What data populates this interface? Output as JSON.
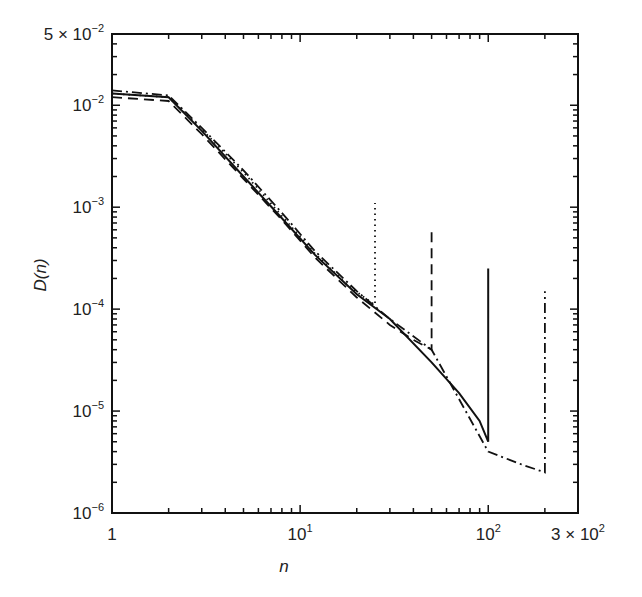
{
  "chart_data": {
    "type": "line",
    "title": "",
    "xlabel": "n",
    "ylabel": "D(n)",
    "xscale": "log",
    "yscale": "log",
    "xlim": [
      1,
      300
    ],
    "ylim": [
      1e-06,
      0.05
    ],
    "grid": false,
    "legend": null,
    "x_tick_labels": [
      "1",
      "10^1",
      "10^2",
      "3 × 10^2"
    ],
    "y_tick_labels": [
      "10^-6",
      "10^-5",
      "10^-4",
      "10^-3",
      "10^-2",
      "5 × 10^-2"
    ],
    "series": [
      {
        "name": "dotted (cutoff n≈25)",
        "style": "dotted",
        "x": [
          1,
          2,
          3,
          5,
          8,
          12,
          18,
          22,
          25,
          25
        ],
        "y": [
          0.013,
          0.012,
          0.0058,
          0.0022,
          0.00082,
          0.00035,
          0.00017,
          0.00013,
          0.00011,
          0.0011
        ]
      },
      {
        "name": "dashed (cutoff n≈50)",
        "style": "dashed",
        "x": [
          1,
          2,
          3,
          5,
          8,
          12,
          20,
          30,
          40,
          50,
          50
        ],
        "y": [
          0.012,
          0.011,
          0.0052,
          0.0019,
          0.00075,
          0.00032,
          0.00013,
          7e-05,
          5e-05,
          4e-05,
          0.0006
        ]
      },
      {
        "name": "solid (cutoff n≈100)",
        "style": "solid",
        "x": [
          1,
          2,
          3,
          5,
          8,
          12,
          20,
          30,
          50,
          70,
          90,
          100,
          100
        ],
        "y": [
          0.013,
          0.012,
          0.0056,
          0.002,
          0.00078,
          0.00034,
          0.00014,
          8e-05,
          3e-05,
          1.5e-05,
          8e-06,
          5e-06,
          0.00025
        ]
      },
      {
        "name": "dash-dot (cutoff n≈200)",
        "style": "dashdot",
        "x": [
          1,
          2,
          3,
          5,
          8,
          12,
          20,
          30,
          50,
          100,
          150,
          200,
          200
        ],
        "y": [
          0.014,
          0.0125,
          0.006,
          0.0023,
          0.00088,
          0.00037,
          0.00015,
          8e-05,
          4e-05,
          4e-06,
          3e-06,
          2.5e-06,
          0.00015
        ]
      }
    ]
  }
}
